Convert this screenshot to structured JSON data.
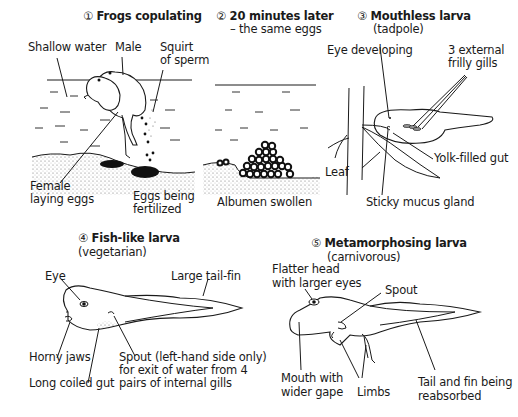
{
  "panels": [
    {
      "id": 1,
      "number": "①",
      "title": "Frogs copulating",
      "subtitle": "",
      "labels": [
        "Shallow water",
        "Male",
        "Squirt",
        "of sperm",
        "Female",
        "laying eggs",
        "Eggs being",
        "fertilized"
      ]
    },
    {
      "id": 2,
      "number": "②",
      "title": "20 minutes later",
      "subtitle": "– the same eggs",
      "labels": [
        "Albumen swollen"
      ]
    },
    {
      "id": 3,
      "number": "③",
      "title": "Mouthless larva",
      "subtitle": "(tadpole)",
      "labels": [
        "Eye developing",
        "3 external",
        "frilly gills",
        "Leaf",
        "Yolk-filled gut",
        "Sticky mucus gland"
      ]
    },
    {
      "id": 4,
      "number": "④",
      "title": "Fish-like larva",
      "subtitle": "(vegetarian)",
      "labels": [
        "Eye",
        "Large tail-fin",
        "Horny jaws",
        "Long coiled gut",
        "Spout (left-hand side only)",
        "for exit of water from 4",
        "pairs of internal gills"
      ]
    },
    {
      "id": 5,
      "number": "⑤",
      "title": "Metamorphosing larva",
      "subtitle": "(carnivorous)",
      "labels": [
        "Flatter  head",
        "with larger eyes",
        "Spout",
        "Mouth with",
        "wider gape",
        "Limbs",
        "Tail and fin being",
        "reabsorbed"
      ]
    }
  ]
}
